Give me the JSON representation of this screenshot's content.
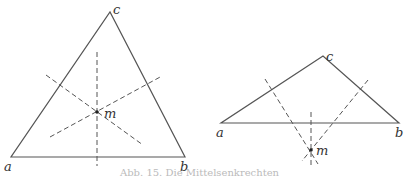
{
  "figures": [
    {
      "name": "acute-triangle",
      "vertices": {
        "a": "a",
        "b": "b",
        "c": "c"
      },
      "center_label": "m",
      "description": "Perpendicular bisectors meet inside the triangle at m"
    },
    {
      "name": "obtuse-triangle",
      "vertices": {
        "a": "a",
        "b": "b",
        "c": "c"
      },
      "center_label": "m",
      "description": "Perpendicular bisectors meet outside the triangle at m"
    }
  ],
  "caption": "Abb. 15. Die Mittelsenkrechten",
  "colors": {
    "line": "#555555",
    "dash": "#555555",
    "text": "#333333"
  }
}
